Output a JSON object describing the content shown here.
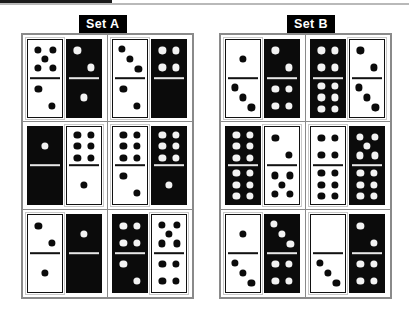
{
  "page": {
    "background_color": "#ffffff",
    "label_background": "#000000",
    "label_text_color": "#ffffff",
    "pip_dark": "#0b0b0b",
    "pip_light": "#f2f2f2",
    "frame_color": "#8a8a8a"
  },
  "sets": [
    {
      "id": "set-a",
      "label": "Set A",
      "pairs": [
        {
          "row": 1,
          "col": 1,
          "dominoes": [
            {
              "color": "white",
              "top": 5,
              "bottom": 2,
              "notation": "5|2"
            },
            {
              "color": "black",
              "top": 2,
              "bottom": 1,
              "notation": "2|1"
            }
          ]
        },
        {
          "row": 1,
          "col": 2,
          "dominoes": [
            {
              "color": "white",
              "top": 3,
              "bottom": 2,
              "notation": "3|2"
            },
            {
              "color": "black",
              "top": 4,
              "bottom": 0,
              "notation": "4|0"
            }
          ]
        },
        {
          "row": 2,
          "col": 1,
          "dominoes": [
            {
              "color": "black",
              "top": 1,
              "bottom": 0,
              "notation": "1|0"
            },
            {
              "color": "white",
              "top": 6,
              "bottom": 1,
              "notation": "6|1"
            }
          ]
        },
        {
          "row": 2,
          "col": 2,
          "dominoes": [
            {
              "color": "white",
              "top": 6,
              "bottom": 2,
              "notation": "6|2"
            },
            {
              "color": "black",
              "top": 6,
              "bottom": 1,
              "notation": "6|1"
            }
          ]
        },
        {
          "row": 3,
          "col": 1,
          "dominoes": [
            {
              "color": "white",
              "top": 2,
              "bottom": 1,
              "notation": "2|1"
            },
            {
              "color": "black",
              "top": 1,
              "bottom": 0,
              "notation": "1|0"
            }
          ]
        },
        {
          "row": 3,
          "col": 2,
          "dominoes": [
            {
              "color": "black",
              "top": 4,
              "bottom": 2,
              "notation": "4|2"
            },
            {
              "color": "white",
              "top": 5,
              "bottom": 4,
              "notation": "5|4"
            }
          ]
        }
      ]
    },
    {
      "id": "set-b",
      "label": "Set B",
      "pairs": [
        {
          "row": 1,
          "col": 1,
          "dominoes": [
            {
              "color": "white",
              "top": 1,
              "bottom": 3,
              "notation": "1|3"
            },
            {
              "color": "black",
              "top": 2,
              "bottom": 4,
              "notation": "2|4"
            }
          ]
        },
        {
          "row": 1,
          "col": 2,
          "dominoes": [
            {
              "color": "black",
              "top": 4,
              "bottom": 6,
              "notation": "4|6"
            },
            {
              "color": "white",
              "top": 2,
              "bottom": 3,
              "notation": "2|3"
            }
          ]
        },
        {
          "row": 2,
          "col": 1,
          "dominoes": [
            {
              "color": "black",
              "top": 6,
              "bottom": 6,
              "notation": "6|6"
            },
            {
              "color": "white",
              "top": 2,
              "bottom": 5,
              "notation": "2|5"
            }
          ]
        },
        {
          "row": 2,
          "col": 2,
          "dominoes": [
            {
              "color": "white",
              "top": 4,
              "bottom": 6,
              "notation": "4|6"
            },
            {
              "color": "black",
              "top": 5,
              "bottom": 6,
              "notation": "5|6"
            }
          ]
        },
        {
          "row": 3,
          "col": 1,
          "dominoes": [
            {
              "color": "white",
              "top": 1,
              "bottom": 3,
              "notation": "1|3"
            },
            {
              "color": "black",
              "top": 3,
              "bottom": 4,
              "notation": "3|4"
            }
          ]
        },
        {
          "row": 3,
          "col": 2,
          "dominoes": [
            {
              "color": "white",
              "top": 0,
              "bottom": 3,
              "notation": "0|3"
            },
            {
              "color": "black",
              "top": 2,
              "bottom": 4,
              "notation": "2|4"
            }
          ]
        }
      ]
    }
  ]
}
